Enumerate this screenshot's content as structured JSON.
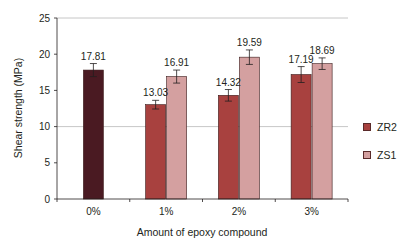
{
  "chart_data": {
    "type": "bar",
    "title": "",
    "xlabel": "Amount of epoxy compound",
    "ylabel": "Shear strength (MPa)",
    "ylim": [
      0,
      25
    ],
    "yticks": [
      0,
      5,
      10,
      15,
      20,
      25
    ],
    "gridlines": [
      10,
      25
    ],
    "categories": [
      "0%",
      "1%",
      "2%",
      "3%"
    ],
    "control": {
      "category": "0%",
      "value": 17.81,
      "error": 0.9,
      "color": "#4a1a22"
    },
    "series": [
      {
        "name": "ZR2",
        "color": "#a8413f",
        "values": [
          null,
          13.03,
          14.32,
          17.19
        ],
        "errors": [
          null,
          0.6,
          0.8,
          1.1
        ]
      },
      {
        "name": "ZS1",
        "color": "#d4a0a0",
        "values": [
          null,
          16.91,
          19.59,
          18.69
        ],
        "errors": [
          null,
          0.9,
          1.0,
          0.8
        ]
      }
    ],
    "value_labels": [
      "17.81",
      "13.03",
      "16.91",
      "14.32",
      "19.59",
      "17.19",
      "18.69"
    ],
    "legend_position": "right"
  },
  "legend": {
    "items": [
      {
        "label": "ZR2",
        "color": "#a8413f"
      },
      {
        "label": "ZS1",
        "color": "#d4a0a0"
      }
    ]
  }
}
